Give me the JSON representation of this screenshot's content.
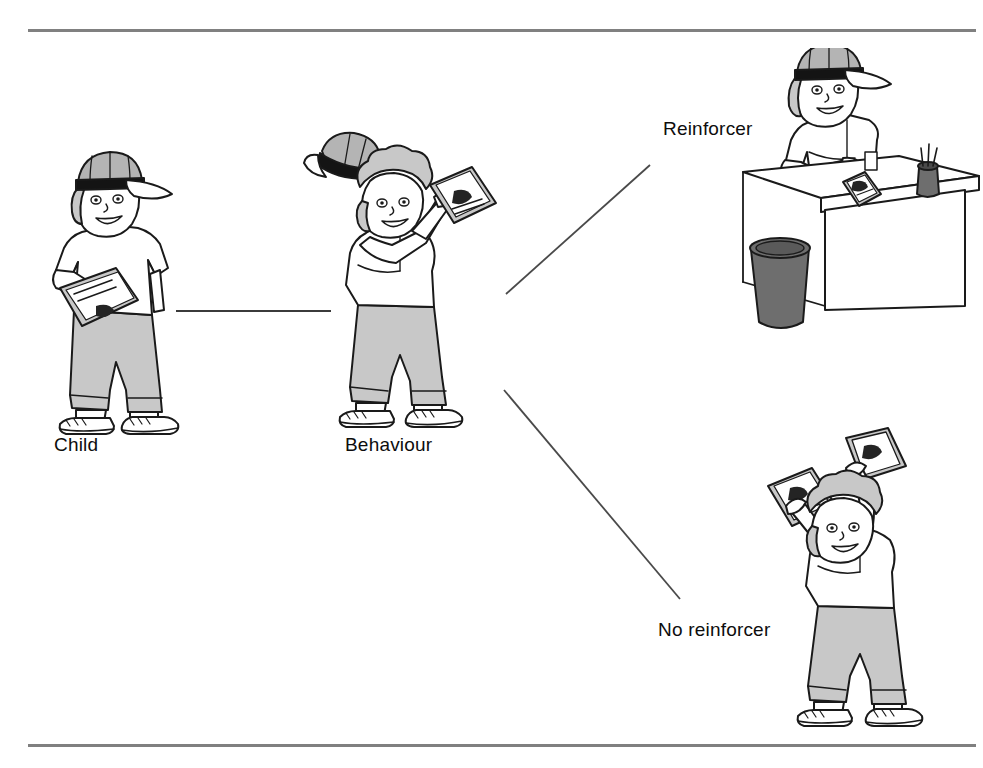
{
  "figure": {
    "type": "instructional-diagram",
    "background_color": "#ffffff",
    "rules": {
      "line_color": "#808080",
      "top_label": "top-horizontal-rule",
      "bottom_label": "bottom-horizontal-rule"
    },
    "labels": {
      "child": "Child",
      "behaviour": "Behaviour",
      "reinforcer": "Reinforcer",
      "no_reinforcer": "No reinforcer"
    },
    "connectors": [
      {
        "name": "child-to-behaviour",
        "style": "straight-horizontal"
      },
      {
        "name": "behaviour-to-reinforcer",
        "style": "diagonal-up-right"
      },
      {
        "name": "behaviour-to-no-reinforcer",
        "style": "diagonal-down-right"
      }
    ],
    "scenes": [
      {
        "name": "child-standing-with-book",
        "description": "Child wearing baseball cap holding a book under one arm",
        "items": [
          "baseball-cap",
          "book",
          "t-shirt",
          "trousers",
          "trainers"
        ]
      },
      {
        "name": "child-throwing-book-and-cap",
        "description": "Child throwing cap and book into the air",
        "items": [
          "flying-cap",
          "book",
          "t-shirt",
          "trousers",
          "trainers"
        ]
      },
      {
        "name": "child-seated-at-desk",
        "description": "Child wearing cap seated at desk with book, pen pot and waste bin",
        "items": [
          "baseball-cap",
          "desk",
          "book",
          "pen-pot",
          "waste-bin"
        ]
      },
      {
        "name": "child-throwing-two-books",
        "description": "Child throwing two books into the air with no cap",
        "items": [
          "book",
          "book",
          "t-shirt",
          "trousers",
          "trainers"
        ]
      }
    ],
    "colors": {
      "outline": "#1a1a1a",
      "skin_fill": "#ffffff",
      "garment_grey": "#c8c8c8",
      "cap_grey": "#b4b4b4",
      "band_black": "#141414",
      "bin_grey": "#6e6e6e",
      "book_grey": "#bdbdbd"
    }
  }
}
